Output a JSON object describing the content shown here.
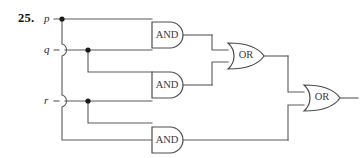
{
  "exercise": {
    "number": "25."
  },
  "diagram": {
    "type": "logic-circuit",
    "inputs": [
      {
        "id": "p",
        "label": "p",
        "y": 19
      },
      {
        "id": "q",
        "label": "q",
        "y": 50
      },
      {
        "id": "r",
        "label": "r",
        "y": 101
      }
    ],
    "gates": [
      {
        "id": "and1",
        "label": "AND",
        "type": "AND",
        "x": 152,
        "y": 22,
        "w": 36,
        "h": 26,
        "inputs": [
          "p",
          "q"
        ]
      },
      {
        "id": "and2",
        "label": "AND",
        "type": "AND",
        "x": 152,
        "y": 72,
        "w": 36,
        "h": 26,
        "inputs": [
          "q",
          "r"
        ]
      },
      {
        "id": "and3",
        "label": "AND",
        "type": "AND",
        "x": 152,
        "y": 127,
        "w": 36,
        "h": 26,
        "inputs": [
          "r",
          "p"
        ]
      },
      {
        "id": "or1",
        "label": "OR",
        "type": "OR",
        "x": 228,
        "y": 43,
        "w": 36,
        "h": 26,
        "inputs": [
          "and1",
          "and2"
        ]
      },
      {
        "id": "or2",
        "label": "OR",
        "type": "OR",
        "x": 304,
        "y": 85,
        "w": 36,
        "h": 26,
        "inputs": [
          "or1",
          "and3"
        ]
      }
    ],
    "junctions": [
      {
        "on": "p",
        "x": 62,
        "y": 19
      },
      {
        "on": "q",
        "x": 88,
        "y": 50
      },
      {
        "on": "r",
        "x": 88,
        "y": 101
      }
    ],
    "wire_hops": [
      {
        "carrier": "p",
        "over": "q",
        "x": 62,
        "y": 50
      },
      {
        "carrier": "p",
        "over": "r",
        "x": 62,
        "y": 101
      }
    ],
    "output": {
      "id": "out",
      "x_end": 358,
      "y": 98
    },
    "colors": {
      "wire": "#5a5a5a",
      "gate_outline": "#4e4e4e",
      "gate_fill": "#ffffff",
      "junction": "#1a1a1a",
      "label_text": "#3b3b3b",
      "background": "#ffffff"
    }
  }
}
